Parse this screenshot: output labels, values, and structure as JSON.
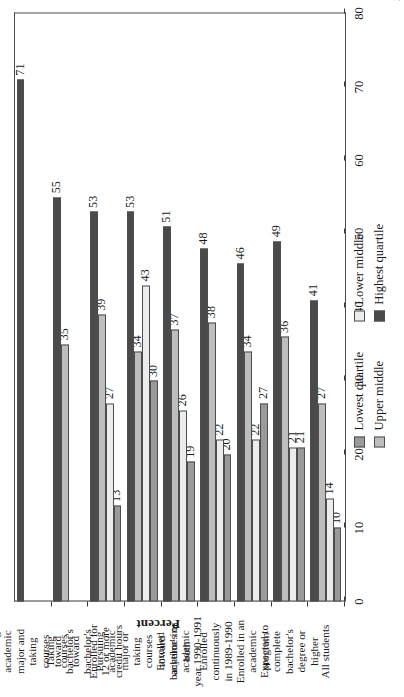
{
  "figure": {
    "rotation_note": "rotated",
    "axis_title": "Percent"
  },
  "chart_data": {
    "type": "bar",
    "title": "",
    "xlabel": "",
    "ylabel": "Percent",
    "ylim": [
      0,
      80
    ],
    "yticks": [
      0,
      10,
      20,
      30,
      40,
      50,
      60,
      70,
      80
    ],
    "grid": false,
    "orientation": "vertical-rotated",
    "legend_position": "bottom-left",
    "categories": [
      "All students",
      "Expected to complete bachelor's degree or higher",
      "Enrolled in an academic program",
      "Enrolled continuously in 1989-1990",
      "Enrolled anytime in academic year 1990-1991",
      "Pursuing academic major or taking courses toward bachelor's or both",
      "Enrolled for 12 or more credit hours",
      "Taking courses toward bachelor's",
      "Pursuing academic major and taking courses toward bachelor's"
    ],
    "category_lines": [
      [
        "All students"
      ],
      [
        "Expected to",
        "complete",
        "bachelor's",
        "degree or",
        "higher"
      ],
      [
        "Enrolled in an",
        "academic",
        "program"
      ],
      [
        "Enrolled",
        "continuously",
        "in 1989-1990"
      ],
      [
        "Enrolled",
        "anytime in",
        "academic",
        "year 1990-1991"
      ],
      [
        "Pursuing",
        "academic",
        "major or",
        "taking",
        "courses",
        "toward",
        "bachelor's or",
        "both"
      ],
      [
        "Enrolled for",
        "12 or more",
        "credit hours"
      ],
      [
        "Taking",
        "courses",
        "toward",
        "bachelor's"
      ],
      [
        "Pursuing",
        "academic",
        "major and",
        "taking",
        "courses",
        "toward",
        "bachelor's"
      ]
    ],
    "series": [
      {
        "name": "Lowest quartile",
        "color": "#9a9a9a",
        "values": [
          10,
          21,
          27,
          20,
          19,
          30,
          13,
          null,
          null
        ]
      },
      {
        "name": "Lower middle",
        "color": "#ececec",
        "values": [
          14,
          21,
          22,
          22,
          26,
          43,
          27,
          null,
          null
        ]
      },
      {
        "name": "Upper middle",
        "color": "#bdbdbd",
        "values": [
          27,
          36,
          34,
          38,
          37,
          34,
          39,
          35,
          null
        ]
      },
      {
        "name": "Highest quartile",
        "color": "#4a4a4a",
        "values": [
          41,
          49,
          46,
          48,
          51,
          53,
          53,
          55,
          71
        ]
      }
    ]
  },
  "legend": {
    "col1": [
      {
        "label": "Lowest quartile",
        "color": "#9a9a9a"
      },
      {
        "label": "Upper middle",
        "color": "#bdbdbd"
      }
    ],
    "col2": [
      {
        "label": "Lower middle",
        "color": "#ececec"
      },
      {
        "label": "Highest quartile",
        "color": "#4a4a4a"
      }
    ]
  }
}
